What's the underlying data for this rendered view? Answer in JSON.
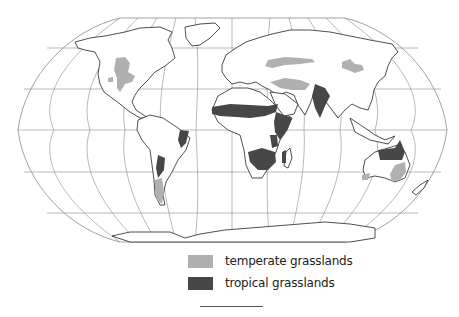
{
  "map": {
    "projection": "Robinson-like world map",
    "center_meridian": "0",
    "graticule_spacing_deg": 30,
    "colors": {
      "temperate": "#b0b0b0",
      "tropical": "#474747",
      "outline": "#222222",
      "graticule": "#8a8a8a",
      "background": "#ffffff"
    }
  },
  "legend": {
    "items": [
      {
        "label": "temperate grasslands",
        "color": "#b0b0b0"
      },
      {
        "label": "tropical grasslands",
        "color": "#474747"
      }
    ]
  }
}
